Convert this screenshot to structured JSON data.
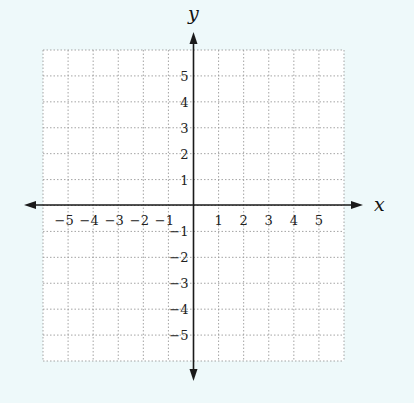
{
  "diagram": {
    "type": "coordinate-plane",
    "axes": {
      "x_label": "x",
      "y_label": "y",
      "x_range": [
        -6,
        6
      ],
      "y_range": [
        -6,
        6
      ]
    },
    "x_ticks": [
      {
        "value": -5,
        "label": "−5"
      },
      {
        "value": -4,
        "label": "−4"
      },
      {
        "value": -3,
        "label": "−3"
      },
      {
        "value": -2,
        "label": "−2"
      },
      {
        "value": -1,
        "label": "−1"
      },
      {
        "value": 1,
        "label": "1"
      },
      {
        "value": 2,
        "label": "2"
      },
      {
        "value": 3,
        "label": "3"
      },
      {
        "value": 4,
        "label": "4"
      },
      {
        "value": 5,
        "label": "5"
      }
    ],
    "y_ticks": [
      {
        "value": 5,
        "label": "5"
      },
      {
        "value": 4,
        "label": "4"
      },
      {
        "value": 3,
        "label": "3"
      },
      {
        "value": 2,
        "label": "2"
      },
      {
        "value": 1,
        "label": "1"
      },
      {
        "value": -1,
        "label": "−1"
      },
      {
        "value": -2,
        "label": "−2"
      },
      {
        "value": -3,
        "label": "−3"
      },
      {
        "value": -4,
        "label": "−4"
      },
      {
        "value": -5,
        "label": "−5"
      }
    ],
    "colors": {
      "background": "#eef9fa",
      "grid_fill": "#ffffff",
      "grid_line": "#9a9a9a",
      "axis": "#1a1a1a"
    }
  }
}
